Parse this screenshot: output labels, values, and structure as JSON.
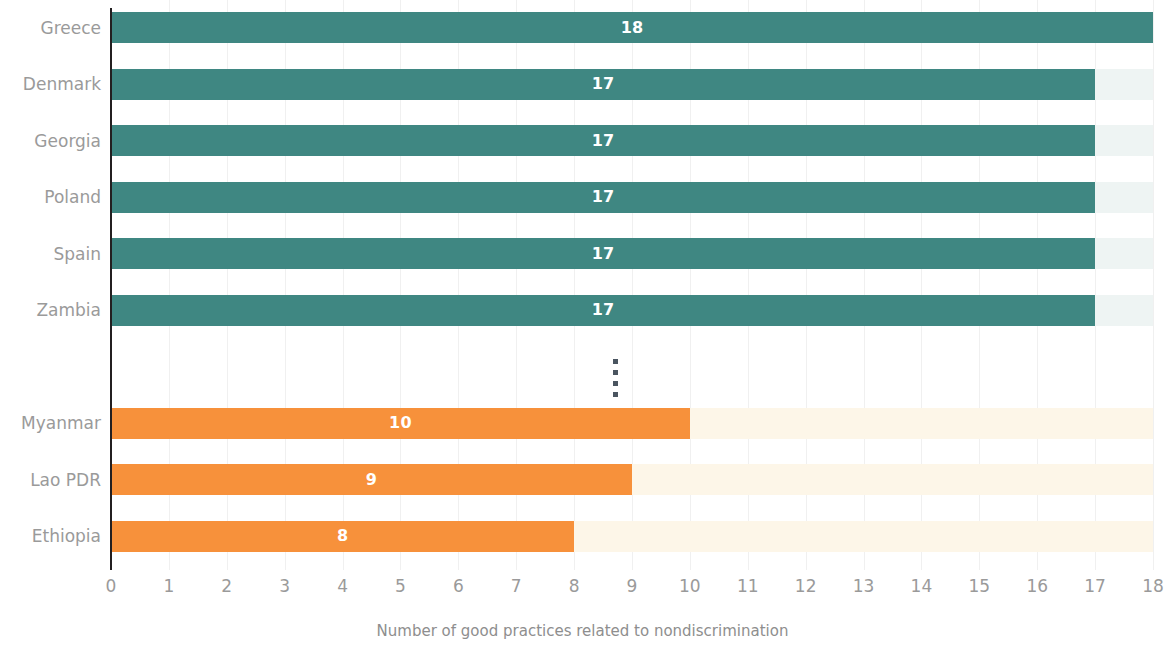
{
  "chart_data": {
    "type": "bar",
    "orientation": "horizontal",
    "title": "",
    "subtitle": "",
    "xlabel": "Number of good practices related to nondiscrimination",
    "ylabel": "",
    "xlim": [
      0,
      18
    ],
    "xticks": [
      "0",
      "1",
      "2",
      "3",
      "4",
      "5",
      "6",
      "7",
      "8",
      "9",
      "10",
      "11",
      "12",
      "13",
      "14",
      "15",
      "16",
      "17",
      "18"
    ],
    "grid": true,
    "legend": "none",
    "categories": [
      "Greece",
      "Denmark",
      "Georgia",
      "Poland",
      "Spain",
      "Zambia",
      "Myanmar",
      "Lao PDR",
      "Ethiopia"
    ],
    "values": [
      18,
      17,
      17,
      17,
      17,
      17,
      10,
      9,
      8
    ],
    "series": [
      {
        "name": "Top performers",
        "color": "#3f8782",
        "track_color": "#eef4f3",
        "points": [
          {
            "category": "Greece",
            "value": 18,
            "label": "18"
          },
          {
            "category": "Denmark",
            "value": 17,
            "label": "17"
          },
          {
            "category": "Georgia",
            "value": 17,
            "label": "17"
          },
          {
            "category": "Poland",
            "value": 17,
            "label": "17"
          },
          {
            "category": "Spain",
            "value": 17,
            "label": "17"
          },
          {
            "category": "Zambia",
            "value": 17,
            "label": "17"
          }
        ]
      },
      {
        "name": "Bottom performers",
        "color": "#f7913b",
        "track_color": "#fdf6e8",
        "points": [
          {
            "category": "Myanmar",
            "value": 10,
            "label": "10"
          },
          {
            "category": "Lao PDR",
            "value": 9,
            "label": "9"
          },
          {
            "category": "Ethiopia",
            "value": 8,
            "label": "8"
          }
        ]
      }
    ],
    "annotations": [
      {
        "name": "average-marker",
        "style": "dotted-vertical-line",
        "value": 8.7,
        "color": "#4a5560"
      }
    ]
  },
  "axis": {
    "x_title": "Number of good practices related to nondiscrimination",
    "tick_color": "#9a9a9a",
    "axis_line_color": "#231f20",
    "gridline_color": "#f0f0f0"
  }
}
